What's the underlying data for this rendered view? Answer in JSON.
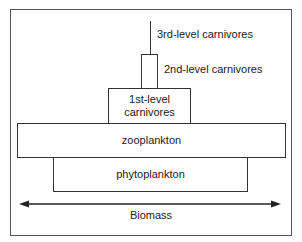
{
  "diagram": {
    "type": "pyramid-of-biomass",
    "levels": [
      {
        "id": "3rd",
        "label": "3rd-level carnivores"
      },
      {
        "id": "2nd",
        "label": "2nd-level carnivores"
      },
      {
        "id": "1st",
        "label": "1st-level carnivores"
      },
      {
        "id": "zoo",
        "label": "zooplankton"
      },
      {
        "id": "phyto",
        "label": "phytoplankton"
      }
    ],
    "axis": {
      "label": "Biomass",
      "arrow": "double-headed"
    }
  }
}
